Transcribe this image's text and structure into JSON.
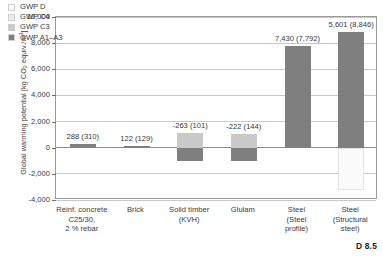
{
  "chart_data": {
    "type": "bar",
    "title": "",
    "xlabel": "",
    "ylabel": "Global warming potential [kg CO2 equiv./m3]",
    "ylabel_parts": {
      "prefix": "Global warming potential [kg CO",
      "sub": "2",
      "mid": " equiv./m",
      "sup": "3",
      "suffix": "]"
    },
    "ylim": [
      -4000,
      10000
    ],
    "yticks": [
      10000,
      8000,
      6000,
      4000,
      2000,
      0,
      -2000,
      -4000
    ],
    "ytick_labels": [
      "10,000",
      "8,000",
      "6,000",
      "4,000",
      "2,000",
      "0",
      "-2,000",
      "-4,000"
    ],
    "grid": true,
    "legend_position": "top-left",
    "legend": [
      {
        "name": "GWP D",
        "color": "#fbfbfb"
      },
      {
        "name": "GWP C4",
        "color": "#ededed"
      },
      {
        "name": "GWP C3",
        "color": "#c9c9c9"
      },
      {
        "name": "GWP A1–A3",
        "color": "#7f7f7f"
      }
    ],
    "categories": [
      "Reinf. concrete C25/30, 2 % rebar",
      "Brick",
      "Solid timber (KVH)",
      "Glulam",
      "Steel (Steel profile)",
      "Steel (Structural steel)"
    ],
    "category_lines": [
      [
        "Reinf. concrete",
        "C25/30,",
        "2 % rebar"
      ],
      [
        "Brick"
      ],
      [
        "Solid timber",
        "(KVH)"
      ],
      [
        "Glulam"
      ],
      [
        "Steel",
        "(Steel",
        "profile)"
      ],
      [
        "Steel",
        "(Structural",
        "steel)"
      ]
    ],
    "data_labels": [
      "288 (310)",
      "122 (129)",
      "-263 (101)",
      "-222 (144)",
      "7,430 (7,792)",
      "5,601 (8,846)"
    ],
    "series": [
      {
        "name": "GWP A1–A3",
        "color": "#7f7f7f",
        "values": [
          310,
          129,
          -1100,
          -1000,
          7792,
          8846
        ]
      },
      {
        "name": "GWP C3",
        "color": "#c9c9c9",
        "values": [
          0,
          0,
          1201,
          1144,
          0,
          0
        ]
      },
      {
        "name": "GWP C4",
        "color": "#ededed",
        "values": [
          0,
          0,
          0,
          0,
          0,
          0
        ]
      },
      {
        "name": "GWP D",
        "color": "#fbfbfb",
        "values": [
          -22,
          -7,
          -364,
          -366,
          -362,
          -3245
        ]
      }
    ],
    "net_values": [
      288,
      122,
      -263,
      -222,
      7430,
      5601
    ],
    "gross_values": [
      310,
      129,
      101,
      144,
      7792,
      8846
    ],
    "bar_segments": [
      {
        "category": "Reinf. concrete C25/30, 2 % rebar",
        "positive": [
          {
            "series": "GWP A1–A3",
            "from": 0,
            "to": 310
          }
        ],
        "negative": []
      },
      {
        "category": "Brick",
        "positive": [
          {
            "series": "GWP A1–A3",
            "from": 0,
            "to": 129
          }
        ],
        "negative": []
      },
      {
        "category": "Solid timber (KVH)",
        "positive": [
          {
            "series": "GWP C3",
            "from": 0,
            "to": 1100
          }
        ],
        "negative": [
          {
            "series": "GWP A1–A3",
            "from": 0,
            "to": -1050
          }
        ]
      },
      {
        "category": "Glulam",
        "positive": [
          {
            "series": "GWP C3",
            "from": 0,
            "to": 1050
          }
        ],
        "negative": [
          {
            "series": "GWP A1–A3",
            "from": 0,
            "to": -1000
          }
        ]
      },
      {
        "category": "Steel (Steel profile)",
        "positive": [
          {
            "series": "GWP A1–A3",
            "from": 0,
            "to": 7792
          }
        ],
        "negative": []
      },
      {
        "category": "Steel (Structural steel)",
        "positive": [
          {
            "series": "GWP A1–A3",
            "from": 0,
            "to": 8846
          }
        ],
        "negative": [
          {
            "series": "GWP D",
            "from": 0,
            "to": -3245
          }
        ]
      }
    ]
  },
  "caption": {
    "text": "D 8.5"
  }
}
